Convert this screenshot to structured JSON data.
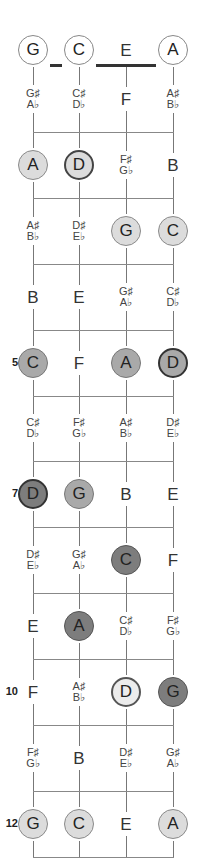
{
  "diagram": {
    "strings": [
      "G",
      "C",
      "E",
      "A"
    ],
    "open_notes": [
      {
        "note": "G",
        "style": "c-open"
      },
      {
        "note": "C",
        "style": "c-open"
      },
      {
        "note": "E",
        "style": "plain"
      },
      {
        "note": "A",
        "style": "c-open"
      }
    ],
    "fret_labels": [
      {
        "fret": 5,
        "label": "5"
      },
      {
        "fret": 7,
        "label": "7"
      },
      {
        "fret": 10,
        "label": "10"
      },
      {
        "fret": 12,
        "label": "12"
      }
    ],
    "frets": [
      {
        "fret": 1,
        "cells": [
          {
            "sharp": "G♯",
            "flat": "A♭"
          },
          {
            "sharp": "C♯",
            "flat": "D♭"
          },
          {
            "note": "F"
          },
          {
            "sharp": "A♯",
            "flat": "B♭"
          }
        ]
      },
      {
        "fret": 2,
        "cells": [
          {
            "note": "A",
            "circle": "c-light"
          },
          {
            "note": "D",
            "circle": "c-lightbold"
          },
          {
            "sharp": "F♯",
            "flat": "G♭"
          },
          {
            "note": "B"
          }
        ]
      },
      {
        "fret": 3,
        "cells": [
          {
            "sharp": "A♯",
            "flat": "B♭"
          },
          {
            "sharp": "D♯",
            "flat": "E♭"
          },
          {
            "note": "G",
            "circle": "c-light"
          },
          {
            "note": "C",
            "circle": "c-light"
          }
        ]
      },
      {
        "fret": 4,
        "cells": [
          {
            "note": "B"
          },
          {
            "note": "E"
          },
          {
            "sharp": "G♯",
            "flat": "A♭"
          },
          {
            "sharp": "C♯",
            "flat": "D♭"
          }
        ]
      },
      {
        "fret": 5,
        "cells": [
          {
            "note": "C",
            "circle": "c-mid"
          },
          {
            "note": "F"
          },
          {
            "note": "A",
            "circle": "c-mid"
          },
          {
            "note": "D",
            "circle": "c-midbold"
          }
        ]
      },
      {
        "fret": 6,
        "cells": [
          {
            "sharp": "C♯",
            "flat": "D♭"
          },
          {
            "sharp": "F♯",
            "flat": "G♭"
          },
          {
            "sharp": "A♯",
            "flat": "B♭"
          },
          {
            "sharp": "D♯",
            "flat": "E♭"
          }
        ]
      },
      {
        "fret": 7,
        "cells": [
          {
            "note": "D",
            "circle": "c-darkbold"
          },
          {
            "note": "G",
            "circle": "c-mid"
          },
          {
            "note": "B"
          },
          {
            "note": "E"
          }
        ]
      },
      {
        "fret": 8,
        "cells": [
          {
            "sharp": "D♯",
            "flat": "E♭"
          },
          {
            "sharp": "G♯",
            "flat": "A♭"
          },
          {
            "note": "C",
            "circle": "c-dark"
          },
          {
            "note": "F"
          }
        ]
      },
      {
        "fret": 9,
        "cells": [
          {
            "note": "E"
          },
          {
            "note": "A",
            "circle": "c-dark"
          },
          {
            "sharp": "C♯",
            "flat": "D♭"
          },
          {
            "sharp": "F♯",
            "flat": "G♭"
          }
        ]
      },
      {
        "fret": 10,
        "cells": [
          {
            "note": "F"
          },
          {
            "sharp": "A♯",
            "flat": "B♭"
          },
          {
            "note": "D",
            "circle": "c-white-bold"
          },
          {
            "note": "G",
            "circle": "c-dark"
          }
        ]
      },
      {
        "fret": 11,
        "cells": [
          {
            "sharp": "F♯",
            "flat": "G♭"
          },
          {
            "note": "B"
          },
          {
            "sharp": "D♯",
            "flat": "E♭"
          },
          {
            "sharp": "G♯",
            "flat": "A♭"
          }
        ]
      },
      {
        "fret": 12,
        "cells": [
          {
            "note": "G",
            "circle": "c-light"
          },
          {
            "note": "C",
            "circle": "c-light"
          },
          {
            "note": "E"
          },
          {
            "note": "A",
            "circle": "c-light"
          }
        ]
      }
    ]
  }
}
